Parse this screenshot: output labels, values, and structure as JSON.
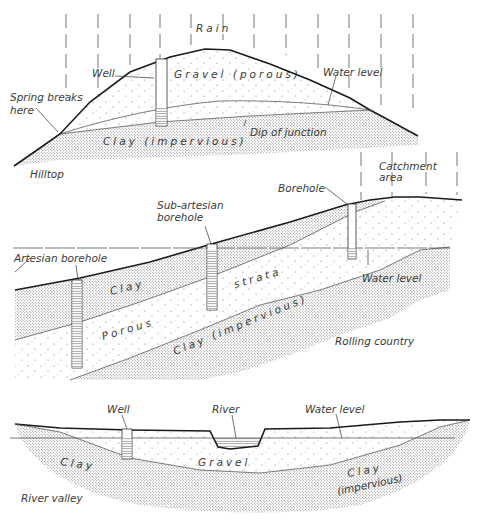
{
  "figure": {
    "panels": [
      {
        "id": "hilltop",
        "title": "Hilltop",
        "labels": {
          "rain": "Rain",
          "well": "Well",
          "gravel": "Gravel (porous)",
          "water_level": "Water level",
          "spring_line1": "Spring breaks",
          "spring_line2": "here",
          "clay": "Clay (impervious)",
          "dip": "Dip of junction"
        }
      },
      {
        "id": "rolling-country",
        "title": "Rolling country",
        "labels": {
          "catchment_line1": "Catchment",
          "catchment_line2": "area",
          "borehole": "Borehole",
          "sub_artesian_line1": "Sub-artesian",
          "sub_artesian_line2": "borehole",
          "artesian": "Artesian borehole",
          "water_level": "Water level",
          "clay_top": "Clay",
          "porous": "Porous",
          "strata": "strata",
          "clay_bottom": "Clay (impervious)"
        }
      },
      {
        "id": "river-valley",
        "title": "River valley",
        "labels": {
          "well": "Well",
          "river": "River",
          "water_level": "Water level",
          "clay_left": "Clay",
          "gravel": "Gravel",
          "clay_right_line1": "Clay",
          "clay_right_line2": "(impervious)"
        }
      }
    ],
    "colors": {
      "ink": "#1a1a1a",
      "stipple_dense": "#6b6b6b",
      "stipple_sparse": "#8a8a8a",
      "background": "#ffffff"
    }
  }
}
